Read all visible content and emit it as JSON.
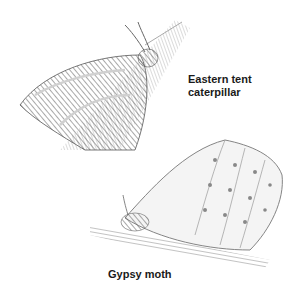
{
  "figure": {
    "labels": {
      "eastern_tent": {
        "line1": "Eastern tent",
        "line2": "caterpillar"
      },
      "gypsy_moth": "Gypsy moth"
    },
    "colors": {
      "background": "#ffffff",
      "ink": "#1a1a1a",
      "pencil_dark": "#555555",
      "pencil_mid": "#8a8a8a",
      "pencil_light": "#bdbdbd"
    }
  }
}
